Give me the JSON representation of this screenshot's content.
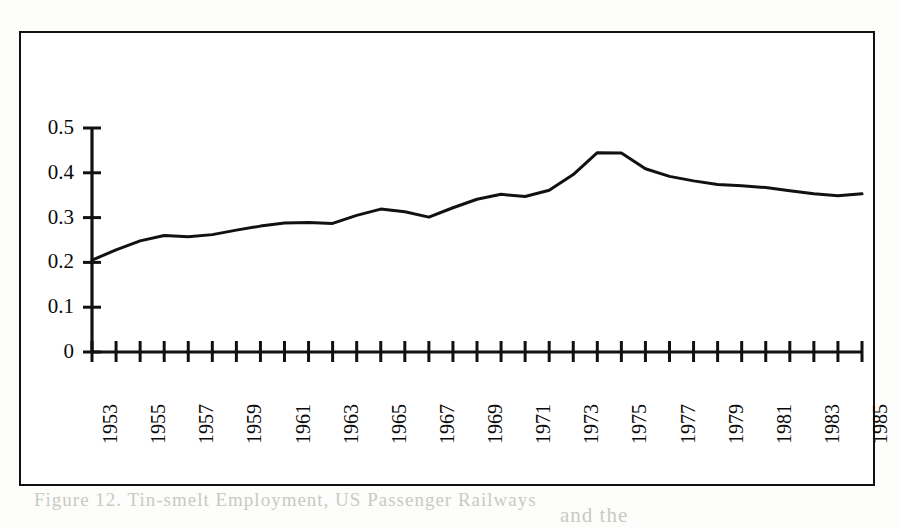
{
  "figure": {
    "frame": {
      "border_color": "#111111"
    },
    "background": "#ffffff"
  },
  "bleed_through": {
    "line1": "Figure 12.  Tin-smelt Employment, US Passenger Railways",
    "line2": "and the"
  },
  "chart_data": {
    "type": "line",
    "title": "",
    "subtitle": "",
    "xlabel": "",
    "ylabel": "",
    "grid": false,
    "legend": false,
    "legend_position": "none",
    "line_color": "#111111",
    "line_width": 3.0,
    "xlim": [
      1953,
      1985
    ],
    "ylim": [
      0,
      0.5
    ],
    "ytick_values": [
      0,
      0.1,
      0.2,
      0.3,
      0.4,
      0.5
    ],
    "ytick_labels": [
      "0",
      "0.1",
      "0.2",
      "0.3",
      "0.4",
      "0.5"
    ],
    "xtick_values": [
      1953,
      1954,
      1955,
      1956,
      1957,
      1958,
      1959,
      1960,
      1961,
      1962,
      1963,
      1964,
      1965,
      1966,
      1967,
      1968,
      1969,
      1970,
      1971,
      1972,
      1973,
      1974,
      1975,
      1976,
      1977,
      1978,
      1979,
      1980,
      1981,
      1982,
      1983,
      1984,
      1985
    ],
    "xtick_labels_shown": [
      "1953",
      "1955",
      "1957",
      "1959",
      "1961",
      "1963",
      "1965",
      "1967",
      "1969",
      "1971",
      "1973",
      "1975",
      "1977",
      "1979",
      "1981",
      "1983",
      "1985"
    ],
    "xtick_label_rotation": -90,
    "x": [
      1953,
      1954,
      1955,
      1956,
      1957,
      1958,
      1959,
      1960,
      1961,
      1962,
      1963,
      1964,
      1965,
      1966,
      1967,
      1968,
      1969,
      1970,
      1971,
      1972,
      1973,
      1974,
      1975,
      1976,
      1977,
      1978,
      1979,
      1980,
      1981,
      1982,
      1983,
      1984,
      1985
    ],
    "values": [
      0.205,
      0.228,
      0.248,
      0.26,
      0.257,
      0.262,
      0.272,
      0.281,
      0.288,
      0.289,
      0.287,
      0.305,
      0.319,
      0.313,
      0.301,
      0.322,
      0.341,
      0.352,
      0.347,
      0.361,
      0.396,
      0.445,
      0.444,
      0.409,
      0.392,
      0.382,
      0.374,
      0.371,
      0.367,
      0.36,
      0.353,
      0.349,
      0.353
    ]
  }
}
